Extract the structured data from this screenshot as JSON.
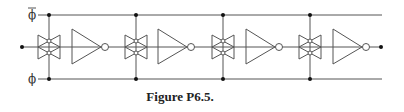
{
  "caption": "Figure P6.5.",
  "labels": {
    "top_rail": "ϕ",
    "top_rail_overbar": true,
    "bottom_rail": "ϕ"
  },
  "circuit": {
    "description": "Chain of four stages, each a CMOS transmission gate followed by an inverter, with clock rails phi-bar (top) and phi (bottom)",
    "stages": [
      {
        "transmission_gate": "TG1",
        "inverter": "INV1"
      },
      {
        "transmission_gate": "TG2",
        "inverter": "INV2"
      },
      {
        "transmission_gate": "TG3",
        "inverter": "INV3"
      },
      {
        "transmission_gate": "TG4",
        "inverter": "INV4"
      }
    ],
    "input_node": "input",
    "output_node": "output"
  },
  "colors": {
    "line": "#555555",
    "dot": "#111111",
    "text": "#222222"
  }
}
